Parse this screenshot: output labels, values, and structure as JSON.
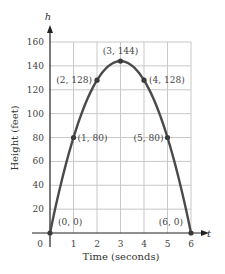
{
  "chart_data": {
    "type": "line",
    "title": "",
    "xlabel": "Time (seconds)",
    "ylabel": "Height (feet)",
    "x_axis_var": "t",
    "y_axis_var": "h",
    "xlim": [
      0,
      6
    ],
    "ylim": [
      0,
      160
    ],
    "grid": true,
    "x_ticks": [
      "0",
      "1",
      "2",
      "3",
      "4",
      "5",
      "6"
    ],
    "y_ticks": [
      "20",
      "40",
      "60",
      "80",
      "100",
      "120",
      "140",
      "160"
    ],
    "x": [
      0,
      1,
      2,
      3,
      4,
      5,
      6
    ],
    "series": [
      {
        "name": "h(t)",
        "values": [
          0,
          80,
          128,
          144,
          128,
          80,
          0
        ]
      }
    ],
    "point_labels": [
      {
        "x": 0,
        "y": 0,
        "text": "(0, 0)"
      },
      {
        "x": 1,
        "y": 80,
        "text": "(1, 80)"
      },
      {
        "x": 2,
        "y": 128,
        "text": "(2, 128)"
      },
      {
        "x": 3,
        "y": 144,
        "text": "(3, 144)"
      },
      {
        "x": 4,
        "y": 128,
        "text": "(4, 128)"
      },
      {
        "x": 5,
        "y": 80,
        "text": "(5, 80)"
      },
      {
        "x": 6,
        "y": 0,
        "text": "(6, 0)"
      }
    ],
    "colors": {
      "curve": "#4a4a4a",
      "grid": "#c8c8c8",
      "axis": "#222222"
    }
  }
}
